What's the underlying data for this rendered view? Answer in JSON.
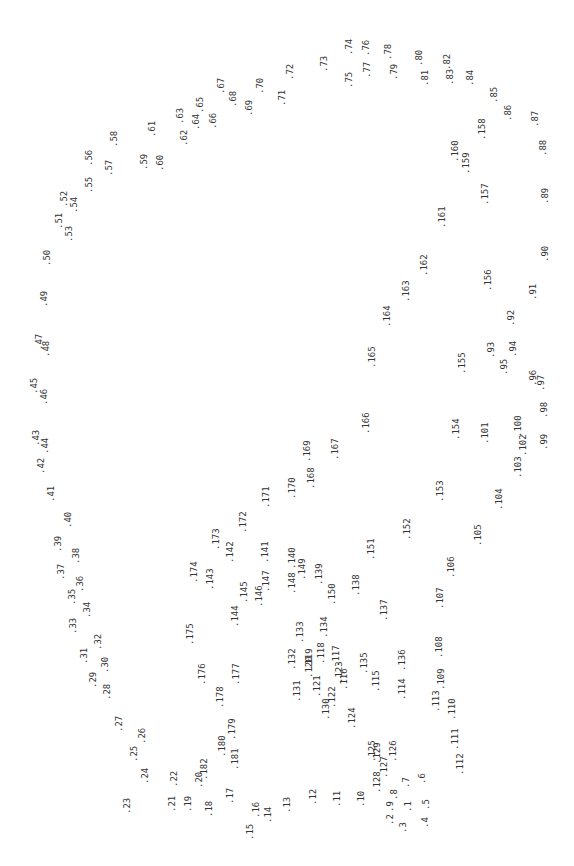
{
  "chart_data": {
    "type": "scatter",
    "title": "",
    "xlabel": "",
    "ylabel": "",
    "grid": false,
    "orientation": "labels rotated -90deg (dot-to-dot numbered points)",
    "color": "#333333",
    "points": [
      {
        "label": ".1",
        "x": 404,
        "y": 812
      },
      {
        "label": ".2",
        "x": 386,
        "y": 825
      },
      {
        "label": ".3",
        "x": 399,
        "y": 833
      },
      {
        "label": ".4",
        "x": 421,
        "y": 828
      },
      {
        "label": ".5",
        "x": 422,
        "y": 810
      },
      {
        "label": ".6",
        "x": 418,
        "y": 784
      },
      {
        "label": ".7",
        "x": 402,
        "y": 788
      },
      {
        "label": ".8",
        "x": 390,
        "y": 800
      },
      {
        "label": ".9",
        "x": 386,
        "y": 812
      },
      {
        "label": ".10",
        "x": 357,
        "y": 807
      },
      {
        "label": ".11",
        "x": 333,
        "y": 807
      },
      {
        "label": ".12",
        "x": 309,
        "y": 805
      },
      {
        "label": ".13",
        "x": 283,
        "y": 813
      },
      {
        "label": ".14",
        "x": 264,
        "y": 823
      },
      {
        "label": ".15",
        "x": 246,
        "y": 840
      },
      {
        "label": ".16",
        "x": 252,
        "y": 818
      },
      {
        "label": ".17",
        "x": 226,
        "y": 804
      },
      {
        "label": ".18",
        "x": 205,
        "y": 817
      },
      {
        "label": ".19",
        "x": 184,
        "y": 812
      },
      {
        "label": ".20",
        "x": 195,
        "y": 788
      },
      {
        "label": ".21",
        "x": 168,
        "y": 812
      },
      {
        "label": ".22",
        "x": 170,
        "y": 787
      },
      {
        "label": ".23",
        "x": 123,
        "y": 814
      },
      {
        "label": ".24",
        "x": 141,
        "y": 784
      },
      {
        "label": ".25",
        "x": 130,
        "y": 762
      },
      {
        "label": ".26",
        "x": 138,
        "y": 744
      },
      {
        "label": ".27",
        "x": 115,
        "y": 732
      },
      {
        "label": ".28",
        "x": 103,
        "y": 700
      },
      {
        "label": ".29",
        "x": 89,
        "y": 688
      },
      {
        "label": ".30",
        "x": 101,
        "y": 673
      },
      {
        "label": ".31",
        "x": 80,
        "y": 664
      },
      {
        "label": ".32",
        "x": 94,
        "y": 650
      },
      {
        "label": ".33",
        "x": 69,
        "y": 634
      },
      {
        "label": ".34",
        "x": 83,
        "y": 618
      },
      {
        "label": ".35",
        "x": 68,
        "y": 605
      },
      {
        "label": ".36",
        "x": 76,
        "y": 592
      },
      {
        "label": ".37",
        "x": 57,
        "y": 580
      },
      {
        "label": ".38",
        "x": 72,
        "y": 564
      },
      {
        "label": ".39",
        "x": 54,
        "y": 552
      },
      {
        "label": ".40",
        "x": 64,
        "y": 528
      },
      {
        "label": ".41",
        "x": 47,
        "y": 502
      },
      {
        "label": ".42",
        "x": 37,
        "y": 474
      },
      {
        "label": ".43",
        "x": 32,
        "y": 446
      },
      {
        "label": ".44",
        "x": 41,
        "y": 454
      },
      {
        "label": ".45",
        "x": 30,
        "y": 394
      },
      {
        "label": ".46",
        "x": 40,
        "y": 405
      },
      {
        "label": ".47",
        "x": 35,
        "y": 350
      },
      {
        "label": ".48",
        "x": 42,
        "y": 357
      },
      {
        "label": ".49",
        "x": 40,
        "y": 307
      },
      {
        "label": ".50",
        "x": 43,
        "y": 266
      },
      {
        "label": ".51",
        "x": 55,
        "y": 229
      },
      {
        "label": ".52",
        "x": 60,
        "y": 207
      },
      {
        "label": ".53",
        "x": 65,
        "y": 242
      },
      {
        "label": ".54",
        "x": 70,
        "y": 213
      },
      {
        "label": ".55",
        "x": 85,
        "y": 193
      },
      {
        "label": ".56",
        "x": 85,
        "y": 166
      },
      {
        "label": ".57",
        "x": 105,
        "y": 176
      },
      {
        "label": ".58",
        "x": 110,
        "y": 147
      },
      {
        "label": ".59",
        "x": 140,
        "y": 170
      },
      {
        "label": ".60",
        "x": 156,
        "y": 171
      },
      {
        "label": ".61",
        "x": 148,
        "y": 137
      },
      {
        "label": ".62",
        "x": 180,
        "y": 146
      },
      {
        "label": ".63",
        "x": 176,
        "y": 124
      },
      {
        "label": ".64",
        "x": 192,
        "y": 130
      },
      {
        "label": ".65",
        "x": 196,
        "y": 113
      },
      {
        "label": ".66",
        "x": 209,
        "y": 129
      },
      {
        "label": ".67",
        "x": 217,
        "y": 94
      },
      {
        "label": ".68",
        "x": 229,
        "y": 107
      },
      {
        "label": ".69",
        "x": 245,
        "y": 116
      },
      {
        "label": ".70",
        "x": 256,
        "y": 94
      },
      {
        "label": ".71",
        "x": 278,
        "y": 106
      },
      {
        "label": ".72",
        "x": 286,
        "y": 80
      },
      {
        "label": ".73",
        "x": 320,
        "y": 72
      },
      {
        "label": ".74",
        "x": 345,
        "y": 55
      },
      {
        "label": ".75",
        "x": 345,
        "y": 88
      },
      {
        "label": ".76",
        "x": 362,
        "y": 56
      },
      {
        "label": ".77",
        "x": 363,
        "y": 78
      },
      {
        "label": ".78",
        "x": 384,
        "y": 60
      },
      {
        "label": ".79",
        "x": 390,
        "y": 80
      },
      {
        "label": ".80",
        "x": 415,
        "y": 66
      },
      {
        "label": ".81",
        "x": 421,
        "y": 86
      },
      {
        "label": ".82",
        "x": 443,
        "y": 70
      },
      {
        "label": ".83",
        "x": 446,
        "y": 85
      },
      {
        "label": ".84",
        "x": 466,
        "y": 86
      },
      {
        "label": ".85",
        "x": 490,
        "y": 103
      },
      {
        "label": ".86",
        "x": 504,
        "y": 121
      },
      {
        "label": ".87",
        "x": 531,
        "y": 127
      },
      {
        "label": ".88",
        "x": 539,
        "y": 156
      },
      {
        "label": ".89",
        "x": 541,
        "y": 204
      },
      {
        "label": ".90",
        "x": 541,
        "y": 262
      },
      {
        "label": ".91",
        "x": 529,
        "y": 300
      },
      {
        "label": ".92",
        "x": 507,
        "y": 326
      },
      {
        "label": ".93",
        "x": 487,
        "y": 358
      },
      {
        "label": ".94",
        "x": 509,
        "y": 357
      },
      {
        "label": ".95",
        "x": 500,
        "y": 375
      },
      {
        "label": ".96",
        "x": 529,
        "y": 386
      },
      {
        "label": ".97",
        "x": 537,
        "y": 391
      },
      {
        "label": ".98",
        "x": 540,
        "y": 418
      },
      {
        "label": ".99",
        "x": 540,
        "y": 450
      },
      {
        "label": ".100",
        "x": 514,
        "y": 437
      },
      {
        "label": ".101",
        "x": 481,
        "y": 444
      },
      {
        "label": ".102",
        "x": 519,
        "y": 456
      },
      {
        "label": ".103",
        "x": 514,
        "y": 478
      },
      {
        "label": ".104",
        "x": 495,
        "y": 510
      },
      {
        "label": ".105",
        "x": 474,
        "y": 546
      },
      {
        "label": ".106",
        "x": 447,
        "y": 578
      },
      {
        "label": ".107",
        "x": 436,
        "y": 609
      },
      {
        "label": ".108",
        "x": 435,
        "y": 658
      },
      {
        "label": ".109",
        "x": 437,
        "y": 690
      },
      {
        "label": ".110",
        "x": 448,
        "y": 720
      },
      {
        "label": ".111",
        "x": 451,
        "y": 750
      },
      {
        "label": ".112",
        "x": 456,
        "y": 775
      },
      {
        "label": ".113",
        "x": 432,
        "y": 712
      },
      {
        "label": ".114",
        "x": 398,
        "y": 700
      },
      {
        "label": ".115",
        "x": 372,
        "y": 692
      },
      {
        "label": ".116",
        "x": 340,
        "y": 690
      },
      {
        "label": ".117",
        "x": 332,
        "y": 667
      },
      {
        "label": ".118",
        "x": 317,
        "y": 664
      },
      {
        "label": ".119",
        "x": 305,
        "y": 670
      },
      {
        "label": ".120",
        "x": 305,
        "y": 678
      },
      {
        "label": ".121",
        "x": 313,
        "y": 697
      },
      {
        "label": ".122",
        "x": 328,
        "y": 708
      },
      {
        "label": ".123",
        "x": 335,
        "y": 683
      },
      {
        "label": ".124",
        "x": 348,
        "y": 729
      },
      {
        "label": ".125",
        "x": 368,
        "y": 762
      },
      {
        "label": ".126",
        "x": 389,
        "y": 762
      },
      {
        "label": ".127",
        "x": 380,
        "y": 778
      },
      {
        "label": ".128",
        "x": 373,
        "y": 793
      },
      {
        "label": ".129",
        "x": 373,
        "y": 764
      },
      {
        "label": ".130",
        "x": 322,
        "y": 720
      },
      {
        "label": ".131",
        "x": 293,
        "y": 702
      },
      {
        "label": ".132",
        "x": 288,
        "y": 670
      },
      {
        "label": ".133",
        "x": 296,
        "y": 643
      },
      {
        "label": ".134",
        "x": 320,
        "y": 638
      },
      {
        "label": ".135",
        "x": 360,
        "y": 674
      },
      {
        "label": ".136",
        "x": 398,
        "y": 671
      },
      {
        "label": ".137",
        "x": 380,
        "y": 621
      },
      {
        "label": ".138",
        "x": 352,
        "y": 596
      },
      {
        "label": ".139",
        "x": 315,
        "y": 585
      },
      {
        "label": ".140",
        "x": 288,
        "y": 569
      },
      {
        "label": ".141",
        "x": 261,
        "y": 563
      },
      {
        "label": ".142",
        "x": 226,
        "y": 563
      },
      {
        "label": ".143",
        "x": 206,
        "y": 590
      },
      {
        "label": ".144",
        "x": 231,
        "y": 627
      },
      {
        "label": ".145",
        "x": 240,
        "y": 603
      },
      {
        "label": ".146",
        "x": 255,
        "y": 607
      },
      {
        "label": ".147",
        "x": 262,
        "y": 592
      },
      {
        "label": ".148",
        "x": 288,
        "y": 594
      },
      {
        "label": ".149",
        "x": 298,
        "y": 580
      },
      {
        "label": ".150",
        "x": 328,
        "y": 605
      },
      {
        "label": ".151",
        "x": 367,
        "y": 560
      },
      {
        "label": ".152",
        "x": 403,
        "y": 540
      },
      {
        "label": ".153",
        "x": 436,
        "y": 502
      },
      {
        "label": ".154",
        "x": 452,
        "y": 440
      },
      {
        "label": ".155",
        "x": 458,
        "y": 374
      },
      {
        "label": ".156",
        "x": 484,
        "y": 291
      },
      {
        "label": ".157",
        "x": 481,
        "y": 205
      },
      {
        "label": ".158",
        "x": 478,
        "y": 140
      },
      {
        "label": ".159",
        "x": 462,
        "y": 174
      },
      {
        "label": ".160",
        "x": 451,
        "y": 162
      },
      {
        "label": ".161",
        "x": 438,
        "y": 228
      },
      {
        "label": ".162",
        "x": 420,
        "y": 276
      },
      {
        "label": ".163",
        "x": 402,
        "y": 302
      },
      {
        "label": ".164",
        "x": 383,
        "y": 327
      },
      {
        "label": ".165",
        "x": 368,
        "y": 368
      },
      {
        "label": ".166",
        "x": 362,
        "y": 434
      },
      {
        "label": ".167",
        "x": 331,
        "y": 460
      },
      {
        "label": ".168",
        "x": 307,
        "y": 489
      },
      {
        "label": ".169",
        "x": 303,
        "y": 462
      },
      {
        "label": ".170",
        "x": 288,
        "y": 499
      },
      {
        "label": ".171",
        "x": 262,
        "y": 508
      },
      {
        "label": ".172",
        "x": 239,
        "y": 533
      },
      {
        "label": ".173",
        "x": 212,
        "y": 550
      },
      {
        "label": ".174",
        "x": 190,
        "y": 583
      },
      {
        "label": ".175",
        "x": 186,
        "y": 645
      },
      {
        "label": ".176",
        "x": 198,
        "y": 685
      },
      {
        "label": ".177",
        "x": 232,
        "y": 685
      },
      {
        "label": ".178",
        "x": 216,
        "y": 708
      },
      {
        "label": ".179",
        "x": 228,
        "y": 740
      },
      {
        "label": ".180",
        "x": 218,
        "y": 757
      },
      {
        "label": ".181",
        "x": 231,
        "y": 770
      },
      {
        "label": ".182",
        "x": 200,
        "y": 780
      }
    ]
  }
}
